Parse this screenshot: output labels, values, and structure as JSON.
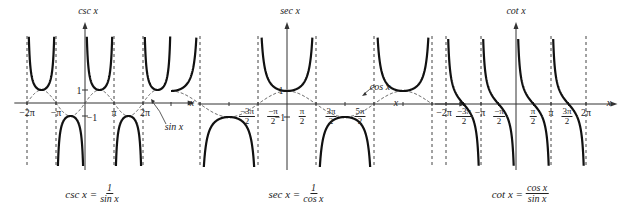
{
  "panels": [
    {
      "id": "csc",
      "axis_label_y": "csc x",
      "axis_label_x": "x",
      "ticks_x": [
        "−2π",
        "−π",
        "π",
        "2π"
      ],
      "ticks_y": [
        "1",
        "−1"
      ],
      "annotation": "sin x",
      "formula": {
        "lhs": "csc x =",
        "num": "1",
        "den": "sin x"
      }
    },
    {
      "id": "sec",
      "axis_label_y": "sec x",
      "axis_label_x": "x",
      "ticks_x": [
        {
          "num": "−3π",
          "den": "2"
        },
        {
          "num": "−π",
          "den": "2"
        },
        {
          "num": "π",
          "den": "2"
        },
        {
          "num": "3π",
          "den": "2"
        },
        {
          "num": "5π",
          "den": "2"
        }
      ],
      "ticks_y": [
        "1",
        "−1"
      ],
      "annotation": "cos x",
      "formula": {
        "lhs": "sec x =",
        "num": "1",
        "den": "cos x"
      }
    },
    {
      "id": "cot",
      "axis_label_y": "cot x",
      "axis_label_x": "x",
      "ticks_x": [
        {
          "text": "−2π"
        },
        {
          "num": "−3π",
          "den": "2"
        },
        {
          "text": "−π"
        },
        {
          "num": "−π",
          "den": "2"
        },
        {
          "num": "π",
          "den": "2"
        },
        {
          "text": "π"
        },
        {
          "num": "3π",
          "den": "2"
        },
        {
          "text": "2π"
        }
      ],
      "formula": {
        "lhs": "cot x =",
        "num": "cos x",
        "den": "sin x"
      }
    }
  ],
  "chart_data": [
    {
      "type": "line",
      "title": "csc x = 1/sin x",
      "xlabel": "x",
      "ylabel": "csc x",
      "xlim": [
        -6.9,
        7.3
      ],
      "ylim": [
        -3.4,
        3.5
      ],
      "series": [
        {
          "name": "csc x",
          "style": "solid",
          "function": "1/sin(x)"
        },
        {
          "name": "sin x",
          "style": "dashed",
          "function": "sin(x)"
        }
      ],
      "asymptotes_x": [
        "-2π",
        "-π",
        "0",
        "π",
        "2π"
      ],
      "tick_labels_x": [
        "−2π",
        "−π",
        "π",
        "2π"
      ],
      "tick_labels_y": [
        "1",
        "−1"
      ]
    },
    {
      "type": "line",
      "title": "sec x = 1/cos x",
      "xlabel": "x",
      "ylabel": "sec x",
      "xlim": [
        -5.5,
        8.3
      ],
      "ylim": [
        -3.4,
        3.5
      ],
      "series": [
        {
          "name": "sec x",
          "style": "solid",
          "function": "1/cos(x)"
        },
        {
          "name": "cos x",
          "style": "dashed",
          "function": "cos(x)"
        }
      ],
      "asymptotes_x": [
        "-3π/2",
        "-π/2",
        "π/2",
        "3π/2",
        "5π/2"
      ],
      "tick_labels_x": [
        "−3π/2",
        "−π/2",
        "π/2",
        "3π/2",
        "5π/2"
      ],
      "tick_labels_y": [
        "1",
        "−1"
      ]
    },
    {
      "type": "line",
      "title": "cot x = cos x/sin x",
      "xlabel": "x",
      "ylabel": "cot x",
      "xlim": [
        -6.9,
        7.3
      ],
      "ylim": [
        -3.4,
        3.5
      ],
      "series": [
        {
          "name": "cot x",
          "style": "solid",
          "function": "cos(x)/sin(x)"
        }
      ],
      "asymptotes_x": [
        "-2π",
        "-π",
        "0",
        "π",
        "2π"
      ],
      "tick_labels_x": [
        "−2π",
        "−3π/2",
        "−π",
        "−π/2",
        "π/2",
        "π",
        "3π/2",
        "2π"
      ]
    }
  ]
}
